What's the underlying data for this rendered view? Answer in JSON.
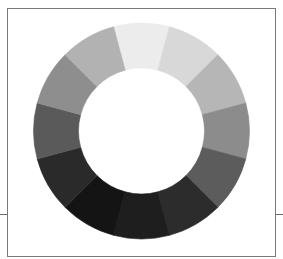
{
  "figure": {
    "type": "grayscale-color-wheel",
    "segment_count": 12,
    "center": [
      141.5,
      131
    ],
    "outer_radius": 108,
    "inner_radius": 63,
    "segments": [
      {
        "index": 0,
        "position": "top",
        "color": "#ececec"
      },
      {
        "index": 1,
        "position": "top-right",
        "color": "#d8d8d8"
      },
      {
        "index": 2,
        "position": "upper-right",
        "color": "#b6b6b6"
      },
      {
        "index": 3,
        "position": "right",
        "color": "#8c8c8c"
      },
      {
        "index": 4,
        "position": "lower-right",
        "color": "#5c5c5c"
      },
      {
        "index": 5,
        "position": "bottom-right",
        "color": "#2c2c2c"
      },
      {
        "index": 6,
        "position": "bottom",
        "color": "#1e1e1e"
      },
      {
        "index": 7,
        "position": "bottom-left",
        "color": "#141414"
      },
      {
        "index": 8,
        "position": "lower-left",
        "color": "#2a2a2a"
      },
      {
        "index": 9,
        "position": "left",
        "color": "#5a5a5a"
      },
      {
        "index": 10,
        "position": "upper-left",
        "color": "#8e8e8e"
      },
      {
        "index": 11,
        "position": "top-left",
        "color": "#b2b2b2"
      }
    ]
  }
}
